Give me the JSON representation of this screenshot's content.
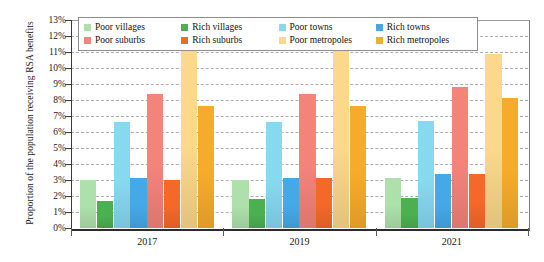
{
  "chart_data": {
    "type": "bar",
    "title": "",
    "xlabel": "",
    "ylabel": "Proportion of the population receiving RSA benefits",
    "categories": [
      "2017",
      "2019",
      "2021"
    ],
    "ylim": [
      0,
      13
    ],
    "ytick_labels": [
      "0%",
      "1%",
      "2%",
      "3%",
      "4%",
      "5%",
      "6%",
      "7%",
      "8%",
      "9%",
      "10%",
      "11%",
      "12%",
      "13%"
    ],
    "ytick_values": [
      0,
      1,
      2,
      3,
      4,
      5,
      6,
      7,
      8,
      9,
      10,
      11,
      12,
      13
    ],
    "grid": true,
    "legend_position": "top-inside",
    "series": [
      {
        "name": "Poor villages",
        "color": "#aee0ab",
        "values": [
          3.0,
          3.0,
          3.1
        ]
      },
      {
        "name": "Rich villages",
        "color": "#4caf50",
        "values": [
          1.7,
          1.8,
          1.9
        ]
      },
      {
        "name": "Poor towns",
        "color": "#87d9f2",
        "values": [
          6.6,
          6.6,
          6.7
        ]
      },
      {
        "name": "Rich towns",
        "color": "#45a9e8",
        "values": [
          3.1,
          3.1,
          3.4
        ]
      },
      {
        "name": "Poor suburbs",
        "color": "#f4837a",
        "values": [
          8.4,
          8.4,
          8.8
        ]
      },
      {
        "name": "Rich suburbs",
        "color": "#f4682a",
        "values": [
          3.0,
          3.1,
          3.4
        ]
      },
      {
        "name": "Poor metropoles",
        "color": "#fbd88a",
        "values": [
          11.1,
          11.1,
          10.9
        ]
      },
      {
        "name": "Rich metropoles",
        "color": "#f7ab2c",
        "values": [
          7.6,
          7.6,
          8.1
        ]
      }
    ]
  },
  "legend": {
    "rows": [
      [
        {
          "label": "Poor villages",
          "color": "#aee0ab"
        },
        {
          "label": "Rich villages",
          "color": "#4caf50"
        },
        {
          "label": "Poor towns",
          "color": "#87d9f2"
        },
        {
          "label": "Rich towns",
          "color": "#45a9e8"
        }
      ],
      [
        {
          "label": "Poor suburbs",
          "color": "#f4837a"
        },
        {
          "label": "Rich suburbs",
          "color": "#f4682a"
        },
        {
          "label": "Poor metropoles",
          "color": "#fbd88a"
        },
        {
          "label": "Rich metropoles",
          "color": "#f7ab2c"
        }
      ]
    ]
  }
}
